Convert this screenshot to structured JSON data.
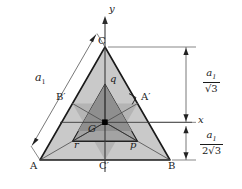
{
  "figure": {
    "colors": {
      "background": "#ffffff",
      "outer_triangle_fill": "#c9c9c9",
      "inner_triangle_fill": "#a8a8a8",
      "center_wedge_fill": "#8c8c8c",
      "stroke": "#1a1a1a",
      "thin_stroke": "#555555"
    }
  },
  "axes": {
    "y_label": "y",
    "x_label": "x"
  },
  "vertices": {
    "a": "A",
    "b": "B",
    "c": "C",
    "a_prime": "A′",
    "b_prime": "B′",
    "c_prime": "C′",
    "centroid": "G"
  },
  "region_labels": {
    "p": "p",
    "q": "q",
    "r": "r"
  },
  "dimensions": {
    "side_label": {
      "symbol": "a",
      "subscript": "1",
      "description": "side length of outer equilateral triangle"
    },
    "upper_right": {
      "numerator": "a",
      "numerator_sub": "1",
      "denominator": "√3",
      "description": "circumradius: distance from centroid to apex C"
    },
    "lower_right": {
      "numerator": "a",
      "numerator_sub": "1",
      "denominator": "2√3",
      "description": "inradius: distance from centroid to base AB"
    },
    "x_tick_label": "x"
  },
  "markers": {
    "right_angle": "right-angle-marker at A′",
    "centroid_dot": "filled square dot at G"
  }
}
